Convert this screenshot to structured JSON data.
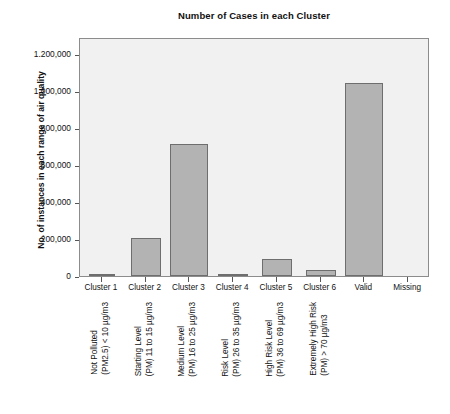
{
  "chart_data": {
    "type": "bar",
    "title": "Number of Cases in each Cluster",
    "xlabel": "",
    "ylabel": "No. of instances in each range of air quality",
    "ylim": [
      0,
      1200000
    ],
    "ytick_values": [
      0,
      200000,
      400000,
      600000,
      800000,
      1000000,
      1200000
    ],
    "ytick_labels": [
      "0",
      "200,000",
      "400,000",
      "600,000",
      "800,000",
      "1.000,000",
      "1.200,000"
    ],
    "grid": false,
    "legend": "none",
    "categories": [
      "Cluster 1",
      "Cluster 2",
      "Cluster 3",
      "Cluster 4",
      "Cluster 5",
      "Cluster 6",
      "Valid",
      "Missing"
    ],
    "values": [
      10000,
      205000,
      715000,
      12000,
      92000,
      33000,
      1045000,
      0
    ],
    "bar_color": "#b3b3b3",
    "bar_edge_color": "#6e6e6e",
    "plot_background": "#f1f1f1",
    "descriptors": [
      {
        "line1": "Not Polluted",
        "line2": "(PM2.5) < 10 µg/m3"
      },
      {
        "line1": "Starting Level",
        "line2": "(PM) 11 to 15 µg/m3"
      },
      {
        "line1": "Medium Level",
        "line2": "(PM) 16 to 25 µg/m3"
      },
      {
        "line1": "Risk Level",
        "line2": "(PM) 26 to 35 µg/m3"
      },
      {
        "line1": "High Risk Level",
        "line2": "(PM) 36 to 69 µg/m3"
      },
      {
        "line1": "Extremely High Risk",
        "line2": "(PM) > 70 µg/m3"
      },
      {
        "line1": "",
        "line2": ""
      },
      {
        "line1": "",
        "line2": ""
      }
    ]
  }
}
